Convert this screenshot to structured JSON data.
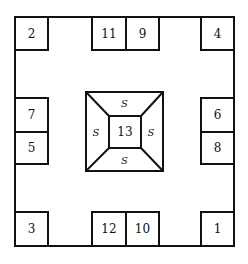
{
  "diagram": {
    "type": "floor-plan-layout",
    "boxes": {
      "top_left": "2",
      "top_mid_left": "11",
      "top_mid_right": "9",
      "top_right": "4",
      "left_upper": "7",
      "left_lower": "5",
      "right_upper": "6",
      "right_lower": "8",
      "bottom_left": "3",
      "bottom_mid_left": "12",
      "bottom_mid_right": "10",
      "bottom_right": "1"
    },
    "center": {
      "label": "13",
      "sides": {
        "top": "S",
        "left": "S",
        "right": "S",
        "bottom": "S"
      }
    },
    "colors": {
      "line": "#111111",
      "background": "#ffffff"
    }
  }
}
